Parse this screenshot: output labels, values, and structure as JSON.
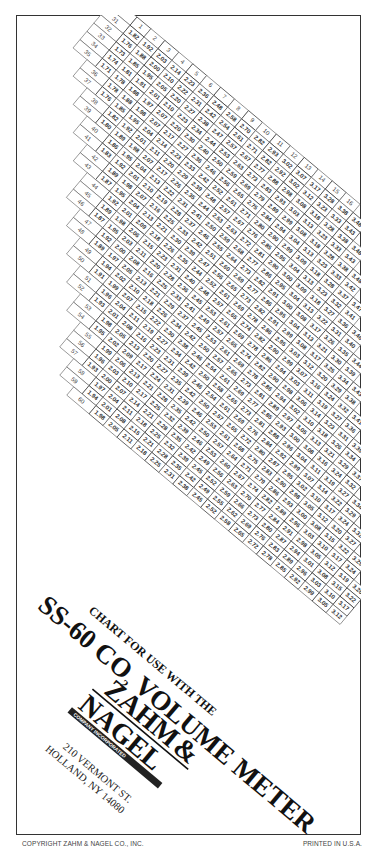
{
  "document": {
    "title_line1": "CHART FOR USE WITH THE",
    "title_line2_prefix": "SS-60 CO",
    "title_line2_sub": "2",
    "title_line2_suffix": " VOLUME METER",
    "brand_line1": "ZAHM",
    "brand_amp": "&",
    "brand_line2": "NAGEL",
    "brand_tagline": "COMPANY INCORPORATED",
    "address_line1": "210 VERMONT ST.",
    "address_line2": "HOLLAND, NY 14080",
    "footer_left": "COPYRIGHT ZAHM & NAGEL CO., INC.",
    "footer_right": "PRINTED IN U.S.A."
  },
  "chart_data": {
    "type": "table",
    "title": "Chart for use with the SS-60 CO2 Volume Meter",
    "row_header": "Temperature (°F)",
    "column_header": "Pressure (psi)",
    "temperatures": [
      30,
      31,
      32,
      33,
      34,
      35,
      36,
      37,
      38,
      39,
      40,
      41,
      42,
      43,
      44,
      45,
      46,
      47,
      48,
      49,
      50,
      51,
      52,
      53,
      54,
      55,
      56,
      57,
      58,
      59,
      60
    ],
    "pressures": [
      1,
      2,
      3,
      4,
      5,
      6,
      7,
      8,
      9,
      10,
      11,
      12,
      13,
      14,
      15,
      16,
      17,
      18,
      19,
      20,
      21,
      22,
      23,
      24,
      25,
      26,
      27,
      28,
      29,
      30
    ],
    "sample_rows": [
      {
        "temp": 31,
        "values": {
          "1": 1.82,
          "2": 1.92,
          "3": 2.03,
          "4": 2.14,
          "5": 2.23,
          "6": 2.36,
          "7": 2.48,
          "8": 2.58,
          "9": 2.7,
          "10": 2.82,
          "11": 2.93,
          "12": 3.02
        }
      },
      {
        "temp": 32,
        "values": {
          "1": 1.76,
          "2": 1.88,
          "3": 2.0,
          "4": 2.1,
          "5": 2.22,
          "6": 2.31,
          "7": 2.42,
          "8": 2.54
        }
      },
      {
        "temp": 33,
        "values": {
          "1": 1.73,
          "2": 1.85,
          "3": 1.95,
          "4": 2.05,
          "5": 2.2,
          "6": 2.27,
          "7": 2.38
        }
      },
      {
        "temp": 34,
        "values": {
          "2": 1.81,
          "3": 1.91,
          "4": 2.01,
          "5": 2.1,
          "6": 2.23
        }
      },
      {
        "temp": 35,
        "values": {
          "2": 1.78,
          "3": 1.88,
          "4": 1.97,
          "5": 2.07
        }
      }
    ]
  }
}
